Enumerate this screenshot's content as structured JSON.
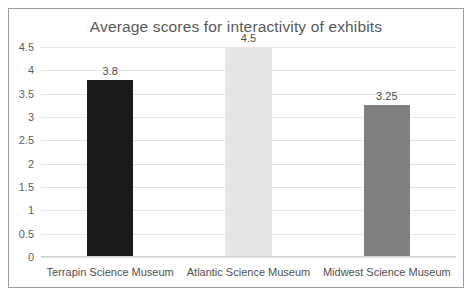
{
  "chart_data": {
    "type": "bar",
    "title": "Average scores for interactivity of exhibits",
    "xlabel": "",
    "ylabel": "",
    "categories": [
      "Terrapin Science Museum",
      "Atlantic Science Museum",
      "Midwest Science Museum"
    ],
    "values": [
      3.8,
      4.5,
      3.25
    ],
    "value_labels": [
      "3.8",
      "4.5",
      "3.25"
    ],
    "bar_colors": [
      "#1a1a1a",
      "#e6e6e6",
      "#808080"
    ],
    "ylim": [
      0,
      4.5
    ],
    "ytick_step": 0.5,
    "ytick_labels": [
      "4.5",
      "4",
      "3.5",
      "3",
      "2.5",
      "2",
      "1.5",
      "1",
      "0.5",
      "0"
    ],
    "ytick_values": [
      4.5,
      4,
      3.5,
      3,
      2.5,
      2,
      1.5,
      1,
      0.5,
      0
    ],
    "grid": "horizontal",
    "legend": "none",
    "series": [
      {
        "name": "Average score",
        "values": [
          3.8,
          4.5,
          3.25
        ]
      }
    ]
  },
  "style": {
    "title_color": "#595959",
    "tick_color": "#616161",
    "gridline_color": "#e3e3e3",
    "border_color": "#9a9a9a",
    "background": "#ffffff"
  }
}
